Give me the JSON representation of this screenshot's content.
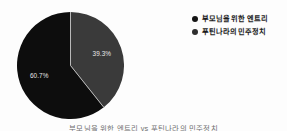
{
  "figure": {
    "background_color": "#fdfdfd",
    "caption": "부모님을 위한 엔트리 vs 푸틴나라의 민주정치"
  },
  "chart_data": {
    "type": "pie",
    "title": "",
    "labels": [
      "부모님을 위한 엔트리",
      "푸틴나라의 민주정치"
    ],
    "values": [
      60.7,
      39.3
    ],
    "value_labels": [
      "60.7%",
      "39.3%"
    ],
    "colors": [
      "#0d0d0d",
      "#3a3a3a"
    ],
    "label_text_color": "#e8e8e8",
    "separator_color": "#b9b9b9",
    "start_angle_deg": 0,
    "direction": "clockwise",
    "legend": {
      "position": "right",
      "entries": [
        {
          "label": "부모님을 위한 엔트리",
          "color": "#141414"
        },
        {
          "label": "푸틴나라의 민주정치",
          "color": "#2e2e2e"
        }
      ]
    },
    "grid": false,
    "xlabel": "",
    "ylabel": ""
  }
}
